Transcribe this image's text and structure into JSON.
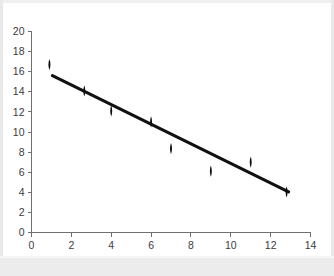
{
  "figure": {
    "kind": "scatter-with-trendline",
    "background_color": "#ffffff",
    "frame_color": "#e9e9e9",
    "marker_color": "#0d0d0d",
    "line_color": "#111111",
    "axis_color": "#6f6f6f",
    "tick_text_color": "#3b3b3b"
  },
  "chart_data": {
    "type": "scatter",
    "title": "",
    "subtitle": "",
    "xlabel": "",
    "ylabel": "",
    "xlim": [
      0,
      14
    ],
    "ylim": [
      0,
      20
    ],
    "xticks": [
      0,
      2,
      4,
      6,
      8,
      10,
      12,
      14
    ],
    "yticks": [
      0,
      2,
      4,
      6,
      8,
      10,
      12,
      14,
      16,
      18,
      20
    ],
    "xtick_labels": [
      "0",
      "2",
      "4",
      "6",
      "8",
      "10",
      "12",
      "14"
    ],
    "ytick_labels": [
      "0",
      "2",
      "4",
      "6",
      "8",
      "10",
      "12",
      "14",
      "16",
      "18",
      "20"
    ],
    "grid": false,
    "legend": null,
    "legend_position": "none",
    "marker": "diamond",
    "series": [
      {
        "name": "observations",
        "type": "scatter",
        "points": [
          {
            "x": 0.9,
            "y": 16.7
          },
          {
            "x": 2.65,
            "y": 14.1
          },
          {
            "x": 4.0,
            "y": 12.1
          },
          {
            "x": 6.0,
            "y": 11.0
          },
          {
            "x": 7.0,
            "y": 8.35
          },
          {
            "x": 9.0,
            "y": 6.1
          },
          {
            "x": 11.0,
            "y": 7.0
          },
          {
            "x": 12.8,
            "y": 4.05
          }
        ]
      },
      {
        "name": "trend-line",
        "type": "line",
        "points": [
          {
            "x": 1.05,
            "y": 15.6
          },
          {
            "x": 12.9,
            "y": 4.05
          }
        ]
      }
    ]
  }
}
